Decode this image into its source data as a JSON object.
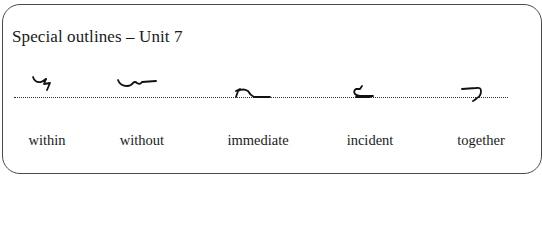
{
  "title": "Special outlines – Unit 7",
  "outlines": [
    {
      "word": "within",
      "icon": "shorthand-outline-within"
    },
    {
      "word": "without",
      "icon": "shorthand-outline-without"
    },
    {
      "word": "immediate",
      "icon": "shorthand-outline-immediate"
    },
    {
      "word": "incident",
      "icon": "shorthand-outline-incident"
    },
    {
      "word": "together",
      "icon": "shorthand-outline-together"
    }
  ]
}
